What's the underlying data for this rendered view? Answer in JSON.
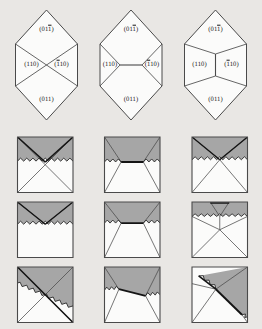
{
  "figure": {
    "background_color": "#e9e7e4",
    "gray_fill": "#a6a6a6",
    "white_fill": "#fbfbfa",
    "line_color": "#4a4a4a",
    "bold_line_color": "#141414",
    "width": 262,
    "height": 329
  },
  "hexagons": {
    "count": 3,
    "items": [
      {
        "id": "hexagon-crossed",
        "center_topology": "crossed-x",
        "labels": {
          "top": {
            "prefix": "(01",
            "overline": "1",
            "suffix": ")"
          },
          "left": {
            "prefix": "(110)",
            "overline": "",
            "suffix": ""
          },
          "right": {
            "prefix": "(",
            "overline": "1",
            "suffix": "10)"
          },
          "bottom": {
            "prefix": "(011)",
            "overline": "",
            "suffix": ""
          }
        }
      },
      {
        "id": "hexagon-horizontal",
        "center_topology": "horizontal-segment",
        "labels": {
          "top": {
            "prefix": "(01",
            "overline": "1",
            "suffix": ")"
          },
          "left": {
            "prefix": "(110)",
            "overline": "",
            "suffix": ""
          },
          "right": {
            "prefix": "(",
            "overline": "1",
            "suffix": "10)"
          },
          "bottom": {
            "prefix": "(011)",
            "overline": "",
            "suffix": ""
          }
        }
      },
      {
        "id": "hexagon-vertical",
        "center_topology": "vertical-segment",
        "labels": {
          "top": {
            "prefix": "(01",
            "overline": "1",
            "suffix": ")"
          },
          "left": {
            "prefix": "(110)",
            "overline": "",
            "suffix": ""
          },
          "right": {
            "prefix": "(",
            "overline": "1",
            "suffix": "10)"
          },
          "bottom": {
            "prefix": "(011)",
            "overline": "",
            "suffix": ""
          }
        }
      }
    ]
  },
  "grid": {
    "rows": 3,
    "columns": 3,
    "cells": [
      {
        "id": "cell-r1c1",
        "row": 1,
        "col": 1,
        "topology": "crossed-x",
        "interface": "horizontal-zigzag",
        "gray_region": "top-triangle-full-width"
      },
      {
        "id": "cell-r1c2",
        "row": 1,
        "col": 2,
        "topology": "horizontal-segment",
        "interface": "horizontal-zigzag-partial",
        "gray_region": "trapezoid-deep"
      },
      {
        "id": "cell-r1c3",
        "row": 1,
        "col": 3,
        "topology": "vertex-converge",
        "interface": "horizontal-zigzag",
        "gray_region": "top-v-wedge"
      },
      {
        "id": "cell-r2c1",
        "row": 2,
        "col": 1,
        "topology": "v-converge-only",
        "interface": "horizontal-zigzag",
        "gray_region": "top-v-wedge-shallow"
      },
      {
        "id": "cell-r2c2",
        "row": 2,
        "col": 2,
        "topology": "horizontal-segment",
        "interface": "horizontal-zigzag-partial",
        "gray_region": "trapezoid-shallow"
      },
      {
        "id": "cell-r2c3",
        "row": 2,
        "col": 3,
        "topology": "vertical-segment",
        "interface": "horizontal-zigzag-high",
        "gray_region": "thin-top-band"
      },
      {
        "id": "cell-r3c1",
        "row": 3,
        "col": 1,
        "topology": "crossed-x-diagonal",
        "interface": "diagonal-zigzag",
        "gray_region": "upper-right-diagonal"
      },
      {
        "id": "cell-r3c2",
        "row": 3,
        "col": 2,
        "topology": "tilted-horizontal-segment",
        "interface": "diagonal-zigzag-partial",
        "gray_region": "trapezoid-tilted"
      },
      {
        "id": "cell-r3c3",
        "row": 3,
        "col": 3,
        "topology": "tilted-y-segment",
        "interface": "diagonal-zigzag-steep",
        "gray_region": "right-diagonal-wedge"
      }
    ]
  }
}
